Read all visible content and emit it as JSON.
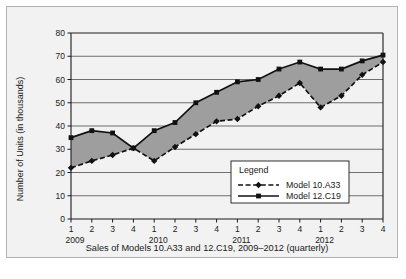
{
  "chart_data": {
    "type": "line",
    "title": "",
    "caption": "Sales of Models 10.A33 and 12.C19, 2009–2012 (quarterly)",
    "xlabel": "",
    "ylabel": "Number of Units (in thousands)",
    "ylim": [
      0,
      80
    ],
    "yticks": [
      0,
      10,
      20,
      30,
      40,
      50,
      60,
      70,
      80
    ],
    "ytick_labels": [
      "0",
      "10",
      "20",
      "30",
      "40",
      "50",
      "60",
      "70",
      "80"
    ],
    "grid": "horizontal",
    "categories": [
      "1",
      "2",
      "3",
      "4",
      "1",
      "2",
      "3",
      "4",
      "1",
      "2",
      "3",
      "4",
      "1",
      "2",
      "3",
      "4"
    ],
    "year_groups": [
      {
        "label": "2009",
        "quarters": [
          "1",
          "2",
          "3",
          "4"
        ]
      },
      {
        "label": "2010",
        "quarters": [
          "1",
          "2",
          "3",
          "4"
        ]
      },
      {
        "label": "2011",
        "quarters": [
          "1",
          "2",
          "3",
          "4"
        ]
      },
      {
        "label": "2012",
        "quarters": [
          "1",
          "2",
          "3",
          "4"
        ]
      }
    ],
    "series": [
      {
        "name": "Model 10.A33",
        "style": "dashed",
        "marker": "diamond",
        "color": "#111111",
        "values": [
          22,
          25,
          27.5,
          30.5,
          25,
          31,
          36.5,
          42,
          43,
          48.5,
          53,
          58.5,
          48,
          53,
          62,
          67.5
        ]
      },
      {
        "name": "Model 12.C19",
        "style": "solid",
        "marker": "square",
        "color": "#111111",
        "values": [
          35,
          38,
          37,
          30.5,
          38,
          41.5,
          50,
          54.5,
          59,
          60,
          64.5,
          67.5,
          64.5,
          64.5,
          68,
          70.5
        ]
      }
    ],
    "band_fill_color": "#9e9e9e",
    "legend": {
      "position": "inside-bottom-right",
      "title": "Legend",
      "entries": [
        {
          "label": "Model 10.A33",
          "style": "dashed",
          "marker": "diamond"
        },
        {
          "label": "Model 12.C19",
          "style": "solid",
          "marker": "square"
        }
      ]
    }
  },
  "figure": {
    "background_color": "#f2f2f2",
    "border_color": "#b3b3b3"
  }
}
